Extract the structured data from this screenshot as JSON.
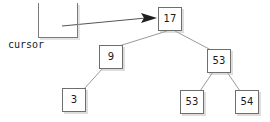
{
  "diagram": {
    "background_color": "#ffffff",
    "edge_color": "#8a8a8a",
    "node_border_color": "#6e6e6e",
    "node_fill_color": "#ffffff",
    "text_color": "#1a1a1a",
    "arrow_color": "#2b2b2b"
  },
  "cursor": {
    "label": "cursor",
    "shape": "u-bracket"
  },
  "pointer": {
    "label": "",
    "from": "cursor",
    "to": "node-17",
    "arrowhead": "filled-triangle"
  },
  "tree": {
    "root": "17",
    "nodes": [
      {
        "id": "node-17",
        "value": "17",
        "x": 158,
        "y": 7
      },
      {
        "id": "node-9",
        "value": "9",
        "x": 99,
        "y": 45
      },
      {
        "id": "node-53-right",
        "value": "53",
        "x": 207,
        "y": 49
      },
      {
        "id": "node-3",
        "value": "3",
        "x": 62,
        "y": 88
      },
      {
        "id": "node-53-leaf",
        "value": "53",
        "x": 180,
        "y": 90
      },
      {
        "id": "node-54",
        "value": "54",
        "x": 235,
        "y": 90
      }
    ],
    "edges": [
      {
        "from": "node-17",
        "to": "node-9"
      },
      {
        "from": "node-17",
        "to": "node-53-right"
      },
      {
        "from": "node-9",
        "to": "node-3"
      },
      {
        "from": "node-53-right",
        "to": "node-53-leaf"
      },
      {
        "from": "node-53-right",
        "to": "node-54"
      }
    ]
  }
}
